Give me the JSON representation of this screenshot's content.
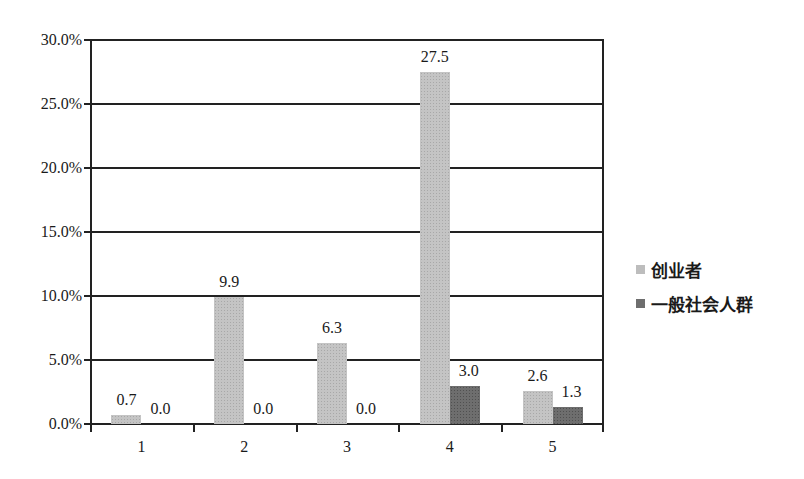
{
  "chart_data": {
    "type": "bar",
    "title": "",
    "xlabel": "",
    "ylabel": "",
    "categories": [
      "1",
      "2",
      "3",
      "4",
      "5"
    ],
    "series": [
      {
        "name": "创业者",
        "values": [
          0.7,
          9.9,
          6.3,
          27.5,
          2.6
        ],
        "color": "#c4c4c4"
      },
      {
        "name": "一般社会人群",
        "values": [
          0.0,
          0.0,
          0.0,
          3.0,
          1.3
        ],
        "color": "#6e6e6e"
      }
    ],
    "value_labels": {
      "创业者": [
        "0.7",
        "9.9",
        "6.3",
        "27.5",
        "2.6"
      ],
      "一般社会人群": [
        "0.0",
        "0.0",
        "0.0",
        "3.0",
        "1.3"
      ]
    },
    "ylim": [
      0,
      30
    ],
    "yticks": [
      "0.0%",
      "5.0%",
      "10.0%",
      "15.0%",
      "20.0%",
      "25.0%",
      "30.0%"
    ],
    "grid": true,
    "legend_position": "right"
  },
  "legend": {
    "items": [
      {
        "label": "创业者"
      },
      {
        "label": "一般社会人群"
      }
    ]
  }
}
